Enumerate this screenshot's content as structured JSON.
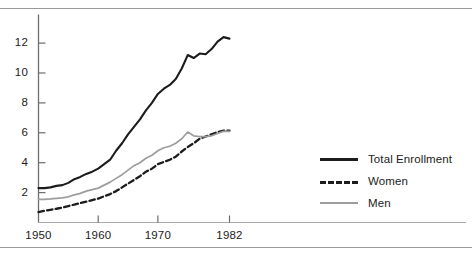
{
  "figure": {
    "has_top_rule": true,
    "has_bottom_rule": true,
    "rule_color": "#9a9a9a"
  },
  "legend": {
    "position": "right",
    "entries": [
      {
        "label": "Total Enrollment",
        "style": "solid",
        "color": "#1c1c1c"
      },
      {
        "label": "Women",
        "style": "dashed",
        "color": "#1c1c1c"
      },
      {
        "label": "Men",
        "style": "solid",
        "color": "#9d9d9d"
      }
    ]
  },
  "chart_data": {
    "type": "line",
    "title": "",
    "xlabel": "",
    "ylabel": "",
    "xlim": [
      1950,
      1982
    ],
    "ylim": [
      0,
      13.4
    ],
    "grid": false,
    "legend_position": "right",
    "xticks": [
      1950,
      1960,
      1970,
      1982
    ],
    "xtick_labels": [
      "1950",
      "1960",
      "1970",
      "1982"
    ],
    "yticks": [
      2,
      4,
      6,
      8,
      10,
      12
    ],
    "ytick_labels": [
      "2",
      "4",
      "6",
      "8",
      "10",
      "12"
    ],
    "x": [
      1950,
      1951,
      1952,
      1953,
      1954,
      1955,
      1956,
      1957,
      1958,
      1959,
      1960,
      1961,
      1962,
      1963,
      1964,
      1965,
      1966,
      1967,
      1968,
      1969,
      1970,
      1971,
      1972,
      1973,
      1974,
      1975,
      1976,
      1977,
      1978,
      1979,
      1980,
      1981,
      1982
    ],
    "series": [
      {
        "name": "Total Enrollment",
        "style": "solid",
        "color": "#1c1c1c",
        "values": [
          2.3,
          2.3,
          2.35,
          2.45,
          2.5,
          2.65,
          2.9,
          3.05,
          3.25,
          3.4,
          3.6,
          3.9,
          4.2,
          4.8,
          5.3,
          5.9,
          6.4,
          6.9,
          7.5,
          8.0,
          8.6,
          8.95,
          9.2,
          9.6,
          10.3,
          11.2,
          11.0,
          11.3,
          11.25,
          11.6,
          12.1,
          12.4,
          12.3
        ]
      },
      {
        "name": "Women",
        "style": "dashed",
        "color": "#1c1c1c",
        "values": [
          0.7,
          0.78,
          0.85,
          0.92,
          1.0,
          1.1,
          1.2,
          1.3,
          1.4,
          1.5,
          1.6,
          1.75,
          1.9,
          2.1,
          2.35,
          2.6,
          2.85,
          3.1,
          3.4,
          3.6,
          3.9,
          4.05,
          4.2,
          4.4,
          4.75,
          5.05,
          5.3,
          5.6,
          5.75,
          5.9,
          6.05,
          6.15,
          6.15
        ]
      },
      {
        "name": "Men",
        "style": "solid",
        "color": "#9d9d9d",
        "values": [
          1.55,
          1.55,
          1.58,
          1.62,
          1.65,
          1.72,
          1.85,
          1.95,
          2.1,
          2.2,
          2.3,
          2.5,
          2.7,
          2.95,
          3.2,
          3.5,
          3.8,
          4.0,
          4.3,
          4.5,
          4.8,
          5.0,
          5.1,
          5.3,
          5.6,
          6.05,
          5.8,
          5.75,
          5.75,
          5.8,
          5.95,
          6.1,
          6.1
        ]
      }
    ]
  }
}
